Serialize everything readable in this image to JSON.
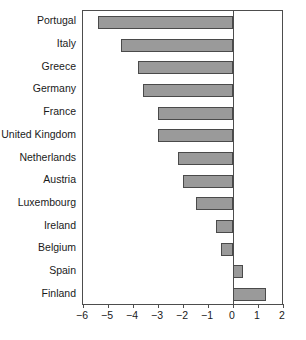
{
  "chart_data": {
    "type": "bar",
    "orientation": "horizontal",
    "title": "",
    "subtitle": "",
    "xlabel": "",
    "ylabel": "",
    "categories": [
      "Portugal",
      "Italy",
      "Greece",
      "Germany",
      "France",
      "United Kingdom",
      "Netherlands",
      "Austria",
      "Luxembourg",
      "Ireland",
      "Belgium",
      "Spain",
      "Finland"
    ],
    "values": [
      -5.4,
      -4.5,
      -3.8,
      -3.6,
      -3.0,
      -3.0,
      -2.2,
      -2.0,
      -1.5,
      -0.7,
      -0.5,
      0.4,
      1.3
    ],
    "xlim": [
      -6,
      2
    ],
    "xticks": [
      -6,
      -5,
      -4,
      -3,
      -2,
      -1,
      0,
      1,
      2
    ],
    "xticklabels": [
      "−6",
      "−5",
      "−4",
      "−3",
      "−2",
      "−1",
      "0",
      "1",
      "2"
    ],
    "grid": false,
    "legend": false,
    "legend_position": "none",
    "zero_reference_line": 0,
    "bar_fill_color": "#9a9a9a",
    "bar_edge_color": "#4a4a4a",
    "frame_color": "#4d4d4d",
    "background_color": "#ffffff"
  }
}
